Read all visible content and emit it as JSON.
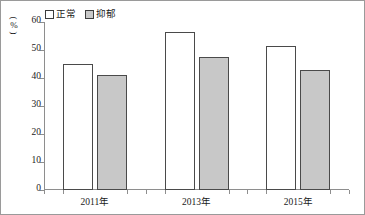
{
  "chart_data": {
    "type": "bar",
    "title": "",
    "xlabel": "",
    "ylabel": "(%)",
    "categories": [
      "2011年",
      "2013年",
      "2015年"
    ],
    "series": [
      {
        "name": "正常",
        "values": [
          45,
          56.5,
          51.5
        ],
        "color": "#ffffff"
      },
      {
        "name": "抑郁",
        "values": [
          41,
          47.5,
          43
        ],
        "color": "#c8c8c8"
      }
    ],
    "ylim": [
      0,
      60
    ],
    "ytick_values": [
      0,
      10,
      20,
      30,
      40,
      50,
      60
    ],
    "ytick_labels": [
      "0",
      "10",
      "20",
      "30",
      "40",
      "50",
      "60"
    ],
    "grid": false,
    "legend_position": "top-left"
  },
  "legend": {
    "items": [
      {
        "label": "正常",
        "swatch": "white-square-outline"
      },
      {
        "label": "抑郁",
        "swatch": "gray-filled-square"
      }
    ]
  },
  "axis": {
    "y_unit_label": "%",
    "y_paren_open": "(",
    "y_paren_close": ")"
  },
  "colors": {
    "bar_normal_fill": "#ffffff",
    "bar_depressed_fill": "#c8c8c8",
    "bar_outline": "#4a4a4a",
    "axis": "#8e8e8e",
    "text": "#1a1a1a",
    "frame": "#9a9a9a"
  }
}
